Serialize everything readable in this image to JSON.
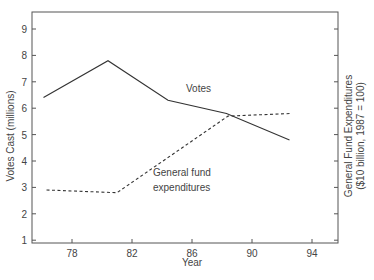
{
  "chart_data": {
    "type": "line",
    "title": "",
    "xlabel": "Year",
    "ylabel": "Votes Cast (millions)",
    "y2label_line1": "General Fund Expenditures",
    "y2label_line2": "($10 billion, 1987 = 100)",
    "xlim": [
      75.4,
      95.6
    ],
    "ylim": [
      0.9,
      9.6
    ],
    "xticks": [
      78,
      82,
      86,
      90,
      94
    ],
    "yticks": [
      1,
      2,
      3,
      4,
      5,
      6,
      7,
      8,
      9
    ],
    "grid": false,
    "legend": "inline annotations",
    "series": [
      {
        "name": "Votes",
        "style": "solid",
        "annotation": [
          "Votes"
        ],
        "x": [
          76.1,
          80.4,
          84.4,
          88.3,
          92.5
        ],
        "values": [
          6.4,
          7.8,
          6.3,
          5.8,
          4.8
        ]
      },
      {
        "name": "General fund expenditures",
        "style": "dashed",
        "annotation": [
          "General fund",
          "expenditures"
        ],
        "x": [
          76.3,
          81.0,
          88.4,
          92.6
        ],
        "values": [
          2.9,
          2.8,
          5.7,
          5.8
        ]
      }
    ]
  }
}
